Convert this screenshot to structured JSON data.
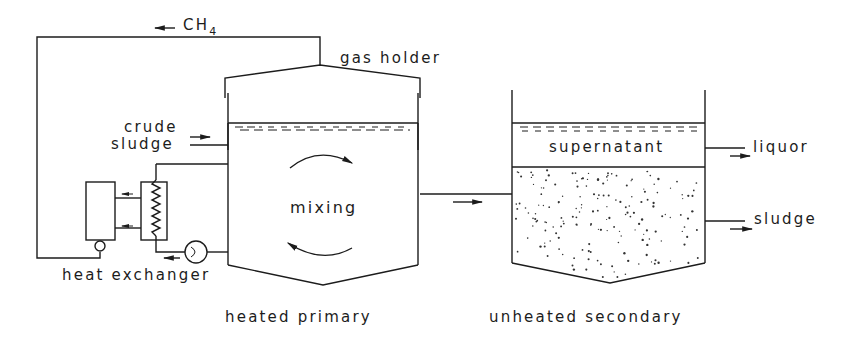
{
  "diagram": {
    "labels": {
      "ch4": "CH",
      "ch4_subscript": "4",
      "gas_holder": "gas holder",
      "crude": "crude",
      "sludge_in": "sludge",
      "mixing": "mixing",
      "heat_exchanger": "heat exchanger",
      "heated_primary": "heated primary",
      "supernatant": "supernatant",
      "liquor": "liquor",
      "sludge_out": "sludge",
      "unheated_secondary": "unheated secondary"
    },
    "components": [
      {
        "id": "primary-digester",
        "label": "heated primary"
      },
      {
        "id": "secondary-digester",
        "label": "unheated secondary"
      },
      {
        "id": "gas-holder",
        "label": "gas holder"
      },
      {
        "id": "heat-exchanger",
        "label": "heat exchanger"
      },
      {
        "id": "pump",
        "label": ""
      }
    ],
    "flows": [
      {
        "from": "gas-holder",
        "to": "heat-exchanger",
        "label": "CH4"
      },
      {
        "from": "inlet",
        "to": "primary-digester",
        "label": "crude sludge"
      },
      {
        "from": "primary-digester",
        "to": "secondary-digester",
        "label": ""
      },
      {
        "from": "secondary-digester",
        "to": "outlet-liquor",
        "label": "liquor"
      },
      {
        "from": "secondary-digester",
        "to": "outlet-sludge",
        "label": "sludge"
      }
    ],
    "colors": {
      "line": "#1c1c1c",
      "background": "#ffffff"
    }
  }
}
